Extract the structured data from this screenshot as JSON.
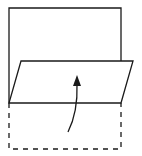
{
  "diagram": {
    "type": "paper-fold-illustration",
    "colors": {
      "stroke": "#1a1a1a",
      "background": "#ffffff"
    },
    "paper_outline": {
      "x1": 8,
      "y1": 8,
      "x2": 121,
      "y2": 103
    },
    "folded_flap": {
      "points": "21,61 133,61 121,103 9,103"
    },
    "original_position_dashed": {
      "x1": 9,
      "y1": 103,
      "x2": 121,
      "y2": 149
    },
    "arrow": {
      "direction": "up",
      "meaning": "fold upward"
    }
  }
}
